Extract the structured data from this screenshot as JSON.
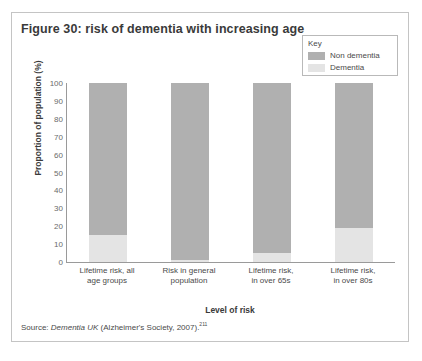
{
  "figure": {
    "title": "Figure 30: risk of dementia with increasing age",
    "source_prefix": "Source: ",
    "source_italic": "Dementia UK",
    "source_rest": " (Alzheimer's Society, 2007).",
    "source_ref": "211"
  },
  "legend": {
    "title": "Key",
    "items": [
      {
        "label": "Non dementia",
        "color": "#b0b0b0"
      },
      {
        "label": "Dementia",
        "color": "#e4e4e4"
      }
    ]
  },
  "chart_data": {
    "type": "bar",
    "stacked": true,
    "title": "Figure 30: risk of dementia with increasing age",
    "xlabel": "Level of risk",
    "ylabel": "Proportion of population (%)",
    "ylim": [
      0,
      100
    ],
    "yticks": [
      100,
      90,
      80,
      70,
      60,
      50,
      40,
      30,
      20,
      10,
      0
    ],
    "grid": false,
    "legend_position": "top-right",
    "categories": [
      "Lifetime risk, all age groups",
      "Risk in general population",
      "Lifetime risk, in over 65s",
      "Lifetime risk, in over 80s"
    ],
    "category_lines": [
      [
        "Lifetime risk, all",
        "age groups"
      ],
      [
        "Risk in general",
        "population"
      ],
      [
        "Lifetime risk,",
        "in over 65s"
      ],
      [
        "Lifetime risk,",
        "in over 80s"
      ]
    ],
    "series": [
      {
        "name": "Dementia",
        "color": "#e4e4e4",
        "values": [
          15,
          1,
          5,
          19
        ]
      },
      {
        "name": "Non dementia",
        "color": "#b0b0b0",
        "values": [
          85,
          99,
          95,
          81
        ]
      }
    ]
  }
}
